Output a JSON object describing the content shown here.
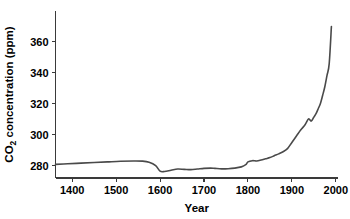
{
  "chart_data": {
    "type": "line",
    "title": "",
    "xlabel": "Year",
    "ylabel": "CO2 concentration (ppm)",
    "ylabel_main": "CO",
    "ylabel_sub": "2",
    "ylabel_rest": " concentration (ppm)",
    "xlim": [
      1362,
      2005
    ],
    "ylim": [
      272,
      380
    ],
    "xticks": [
      1400,
      1500,
      1600,
      1700,
      1800,
      1900,
      2000
    ],
    "xticklabels": [
      "1400",
      "1500",
      "1600",
      "1700",
      "1800",
      "1900",
      "2000"
    ],
    "yticks": [
      280,
      300,
      320,
      340,
      360
    ],
    "yticklabels": [
      "280",
      "300",
      "320",
      "340",
      "360"
    ],
    "grid": false,
    "legend": false,
    "line_color": "#4a4a4a",
    "axis_color": "#3a3a3a",
    "series": [
      {
        "name": "Atmospheric CO2",
        "x": [
          1362,
          1390,
          1420,
          1450,
          1480,
          1510,
          1540,
          1560,
          1575,
          1590,
          1600,
          1610,
          1625,
          1640,
          1655,
          1670,
          1685,
          1700,
          1715,
          1725,
          1740,
          1755,
          1770,
          1785,
          1795,
          1800,
          1810,
          1820,
          1830,
          1840,
          1850,
          1860,
          1870,
          1880,
          1890,
          1900,
          1910,
          1920,
          1930,
          1938,
          1944,
          1950,
          1955,
          1960,
          1965,
          1970,
          1975,
          1980,
          1985,
          1990
        ],
        "y": [
          280.8,
          281.2,
          281.6,
          282.0,
          282.4,
          282.8,
          283.0,
          282.9,
          282.2,
          280.0,
          276.4,
          276.2,
          277.0,
          277.8,
          277.6,
          277.4,
          277.8,
          278.2,
          278.4,
          278.2,
          277.9,
          278.0,
          278.4,
          279.2,
          280.6,
          282.4,
          283.2,
          283.0,
          283.6,
          284.4,
          285.2,
          286.4,
          287.6,
          289.0,
          291.0,
          295.0,
          299.0,
          303.0,
          306.4,
          310.2,
          308.8,
          311.4,
          313.6,
          316.8,
          320.2,
          325.4,
          331.0,
          338.4,
          346.0,
          370.0
        ]
      }
    ]
  }
}
